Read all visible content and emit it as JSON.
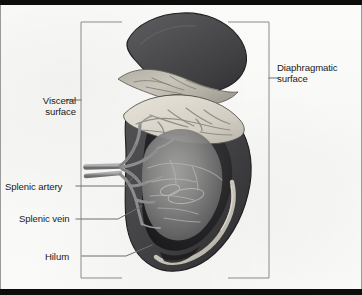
{
  "figure": {
    "kind": "anatomical-illustration",
    "labels": {
      "visceral_surface": "Visceral\nsurface",
      "visceral_surface_line1": "Visceral",
      "visceral_surface_line2": "surface",
      "diaphragmatic_surface": "Diaphragmatic surface",
      "diaphragmatic_surface_line1": "Diaphragmatic",
      "diaphragmatic_surface_line2": "surface",
      "splenic_artery": "Splenic artery",
      "splenic_vein": "Splenic vein",
      "hilum": "Hilum"
    },
    "colors": {
      "parenchyma_dark": "#4a4a4c",
      "parenchyma_darker": "#3a3a3c",
      "capsule_outline": "#232325",
      "cut_surface_pale": "#ddd9ce",
      "cut_surface_light": "#cbc7bd",
      "interior_mid": "#8e8e8e",
      "interior_shadow": "#2b2b2d",
      "vessel_gray": "#9b9b9b",
      "vessel_light": "#c4c2b8",
      "leader_line": "#6f6f6f",
      "bracket_line": "#8b8b8b",
      "frame_black": "#0d0d0d",
      "frame_gray": "#9a9a9a",
      "text": "#1b1b1b",
      "paper": "#fafaf8"
    }
  }
}
